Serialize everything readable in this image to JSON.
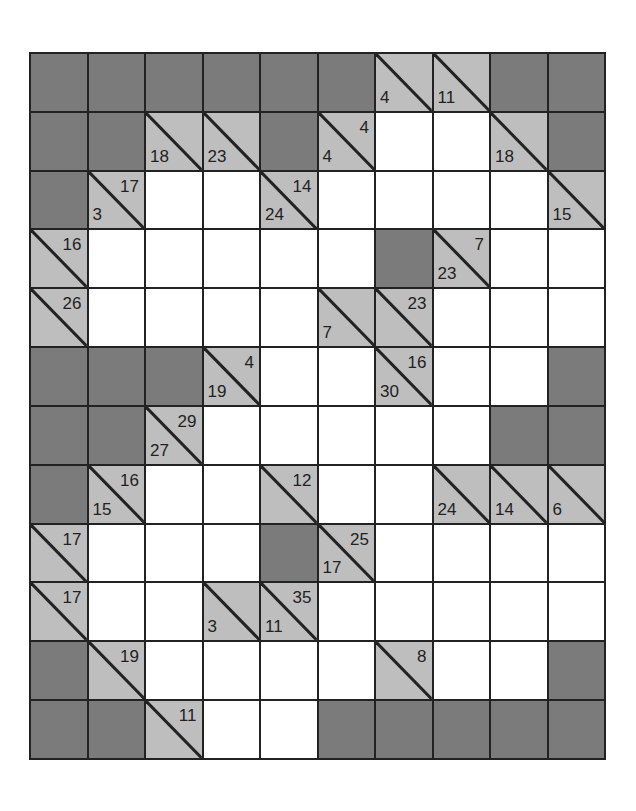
{
  "puzzle": {
    "type": "kakuro",
    "rows": 12,
    "cols": 10,
    "colors": {
      "block": "#7b7b7b",
      "clue": "#bebebe",
      "entry": "#ffffff",
      "line": "#222222"
    },
    "legend": {
      "B": "block",
      "W": "white entry cell",
      "C": "clue cell (a = across sum, d = down sum)"
    },
    "grid": [
      [
        {
          "t": "B"
        },
        {
          "t": "B"
        },
        {
          "t": "B"
        },
        {
          "t": "B"
        },
        {
          "t": "B"
        },
        {
          "t": "B"
        },
        {
          "t": "C",
          "d": "4"
        },
        {
          "t": "C",
          "d": "11"
        },
        {
          "t": "B"
        },
        {
          "t": "B"
        }
      ],
      [
        {
          "t": "B"
        },
        {
          "t": "B"
        },
        {
          "t": "C",
          "d": "18"
        },
        {
          "t": "C",
          "d": "23"
        },
        {
          "t": "B"
        },
        {
          "t": "C",
          "a": "4",
          "d": "4"
        },
        {
          "t": "W"
        },
        {
          "t": "W"
        },
        {
          "t": "C",
          "d": "18"
        },
        {
          "t": "B"
        }
      ],
      [
        {
          "t": "B"
        },
        {
          "t": "C",
          "a": "17",
          "d": "3"
        },
        {
          "t": "W"
        },
        {
          "t": "W"
        },
        {
          "t": "C",
          "a": "14",
          "d": "24"
        },
        {
          "t": "W"
        },
        {
          "t": "W"
        },
        {
          "t": "W"
        },
        {
          "t": "W"
        },
        {
          "t": "C",
          "d": "15"
        }
      ],
      [
        {
          "t": "C",
          "a": "16"
        },
        {
          "t": "W"
        },
        {
          "t": "W"
        },
        {
          "t": "W"
        },
        {
          "t": "W"
        },
        {
          "t": "W"
        },
        {
          "t": "B"
        },
        {
          "t": "C",
          "a": "7",
          "d": "23"
        },
        {
          "t": "W"
        },
        {
          "t": "W"
        }
      ],
      [
        {
          "t": "C",
          "a": "26"
        },
        {
          "t": "W"
        },
        {
          "t": "W"
        },
        {
          "t": "W"
        },
        {
          "t": "W"
        },
        {
          "t": "C",
          "d": "7"
        },
        {
          "t": "C",
          "a": "23"
        },
        {
          "t": "W"
        },
        {
          "t": "W"
        },
        {
          "t": "W"
        }
      ],
      [
        {
          "t": "B"
        },
        {
          "t": "B"
        },
        {
          "t": "B"
        },
        {
          "t": "C",
          "a": "4",
          "d": "19"
        },
        {
          "t": "W"
        },
        {
          "t": "W"
        },
        {
          "t": "C",
          "a": "16",
          "d": "30"
        },
        {
          "t": "W"
        },
        {
          "t": "W"
        },
        {
          "t": "B"
        }
      ],
      [
        {
          "t": "B"
        },
        {
          "t": "B"
        },
        {
          "t": "C",
          "a": "29",
          "d": "27"
        },
        {
          "t": "W"
        },
        {
          "t": "W"
        },
        {
          "t": "W"
        },
        {
          "t": "W"
        },
        {
          "t": "W"
        },
        {
          "t": "B"
        },
        {
          "t": "B"
        }
      ],
      [
        {
          "t": "B"
        },
        {
          "t": "C",
          "a": "16",
          "d": "15"
        },
        {
          "t": "W"
        },
        {
          "t": "W"
        },
        {
          "t": "C",
          "a": "12"
        },
        {
          "t": "W"
        },
        {
          "t": "W"
        },
        {
          "t": "C",
          "d": "24"
        },
        {
          "t": "C",
          "d": "14"
        },
        {
          "t": "C",
          "d": "6"
        }
      ],
      [
        {
          "t": "C",
          "a": "17"
        },
        {
          "t": "W"
        },
        {
          "t": "W"
        },
        {
          "t": "W"
        },
        {
          "t": "B"
        },
        {
          "t": "C",
          "a": "25",
          "d": "17"
        },
        {
          "t": "W"
        },
        {
          "t": "W"
        },
        {
          "t": "W"
        },
        {
          "t": "W"
        }
      ],
      [
        {
          "t": "C",
          "a": "17"
        },
        {
          "t": "W"
        },
        {
          "t": "W"
        },
        {
          "t": "C",
          "d": "3"
        },
        {
          "t": "C",
          "a": "35",
          "d": "11"
        },
        {
          "t": "W"
        },
        {
          "t": "W"
        },
        {
          "t": "W"
        },
        {
          "t": "W"
        },
        {
          "t": "W"
        }
      ],
      [
        {
          "t": "B"
        },
        {
          "t": "C",
          "a": "19"
        },
        {
          "t": "W"
        },
        {
          "t": "W"
        },
        {
          "t": "W"
        },
        {
          "t": "W"
        },
        {
          "t": "C",
          "a": "8"
        },
        {
          "t": "W"
        },
        {
          "t": "W"
        },
        {
          "t": "B"
        }
      ],
      [
        {
          "t": "B"
        },
        {
          "t": "B"
        },
        {
          "t": "C",
          "a": "11"
        },
        {
          "t": "W"
        },
        {
          "t": "W"
        },
        {
          "t": "B"
        },
        {
          "t": "B"
        },
        {
          "t": "B"
        },
        {
          "t": "B"
        },
        {
          "t": "B"
        }
      ]
    ]
  }
}
